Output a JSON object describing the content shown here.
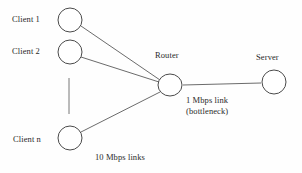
{
  "diagram": {
    "background_color": "#fefefe",
    "stroke_color": "#4a4a4a",
    "text_color": "#2a2a2a",
    "nodes": [
      {
        "id": "client1",
        "label": "Client 1",
        "shape": "ellipse",
        "cx": 70,
        "cy": 20,
        "rx": 12,
        "ry": 12
      },
      {
        "id": "client2",
        "label": "Client 2",
        "shape": "ellipse",
        "cx": 70,
        "cy": 52,
        "rx": 12,
        "ry": 12
      },
      {
        "id": "clientn",
        "label": "Client n",
        "shape": "ellipse",
        "cx": 70,
        "cy": 138,
        "rx": 12,
        "ry": 12
      },
      {
        "id": "router",
        "label": "Router",
        "shape": "ellipse",
        "cx": 170,
        "cy": 85,
        "rx": 12,
        "ry": 11
      },
      {
        "id": "server",
        "label": "Server",
        "shape": "ellipse",
        "cx": 274,
        "cy": 82,
        "rx": 12,
        "ry": 12
      }
    ],
    "edges": [
      {
        "id": "edge-client1-router",
        "from": "client1",
        "to": "router"
      },
      {
        "id": "edge-client2-router",
        "from": "client2",
        "to": "router"
      },
      {
        "id": "edge-clientn-router",
        "from": "clientn",
        "to": "router"
      },
      {
        "id": "edge-router-server",
        "from": "router",
        "to": "server"
      }
    ],
    "ellipsis": {
      "id": "vertical-ellipsis",
      "description": "vertical line indicating omitted clients",
      "x": 69,
      "y1": 78,
      "y2": 114
    },
    "labels": {
      "access_links": "10 Mbps links",
      "bottleneck_line1": "1 Mbps link",
      "bottleneck_line2": "(bottleneck)"
    }
  }
}
